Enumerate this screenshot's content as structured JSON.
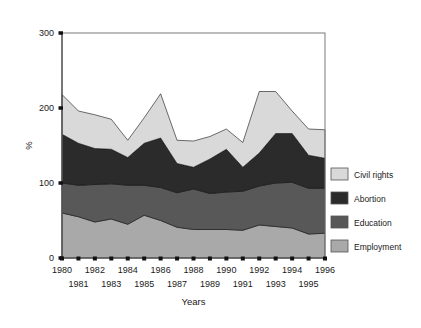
{
  "chart_data": {
    "type": "area",
    "stacked": true,
    "title": "",
    "xlabel": "Years",
    "ylabel": "%",
    "ylim": [
      0,
      300
    ],
    "yticks": [
      0,
      100,
      200,
      300
    ],
    "xlim": [
      1980,
      1996
    ],
    "grid": false,
    "legend_position": "right",
    "categories": [
      1980,
      1981,
      1982,
      1983,
      1984,
      1985,
      1986,
      1987,
      1988,
      1989,
      1990,
      1991,
      1992,
      1993,
      1994,
      1995,
      1996
    ],
    "xtick_labels_top": [
      "1980",
      "",
      "1982",
      "",
      "1984",
      "",
      "1986",
      "",
      "1988",
      "",
      "1990",
      "",
      "1992",
      "",
      "1994",
      "",
      "1996"
    ],
    "xtick_labels_bottom": [
      "",
      "1981",
      "",
      "1983",
      "",
      "1985",
      "",
      "1987",
      "",
      "1989",
      "",
      "1991",
      "",
      "1993",
      "",
      "1995",
      ""
    ],
    "series": [
      {
        "name": "Employment",
        "color": "#a9a9a9",
        "values": [
          60,
          55,
          48,
          52,
          45,
          57,
          50,
          41,
          38,
          38,
          38,
          37,
          44,
          42,
          40,
          32,
          33
        ]
      },
      {
        "name": "Education",
        "color": "#585858",
        "values": [
          40,
          42,
          50,
          47,
          52,
          40,
          44,
          46,
          54,
          48,
          50,
          52,
          52,
          58,
          61,
          61,
          60
        ]
      },
      {
        "name": "Abortion",
        "color": "#2b2b2b",
        "values": [
          65,
          56,
          48,
          46,
          37,
          56,
          66,
          39,
          29,
          46,
          57,
          32,
          44,
          66,
          65,
          44,
          40
        ]
      },
      {
        "name": "Civil rights",
        "color": "#d9d9d9",
        "values": [
          53,
          43,
          45,
          40,
          23,
          34,
          59,
          31,
          35,
          30,
          27,
          33,
          82,
          56,
          30,
          35,
          38
        ]
      }
    ],
    "totals": [
      218,
      196,
      191,
      185,
      157,
      187,
      219,
      157,
      156,
      162,
      172,
      154,
      222,
      222,
      196,
      172,
      171
    ]
  },
  "legend": {
    "items": [
      {
        "label": "Civil rights",
        "color": "#d9d9d9"
      },
      {
        "label": "Abortion",
        "color": "#2b2b2b"
      },
      {
        "label": "Education",
        "color": "#585858"
      },
      {
        "label": "Employment",
        "color": "#a9a9a9"
      }
    ]
  },
  "axes": {
    "y_title": "%",
    "x_title": "Years"
  }
}
